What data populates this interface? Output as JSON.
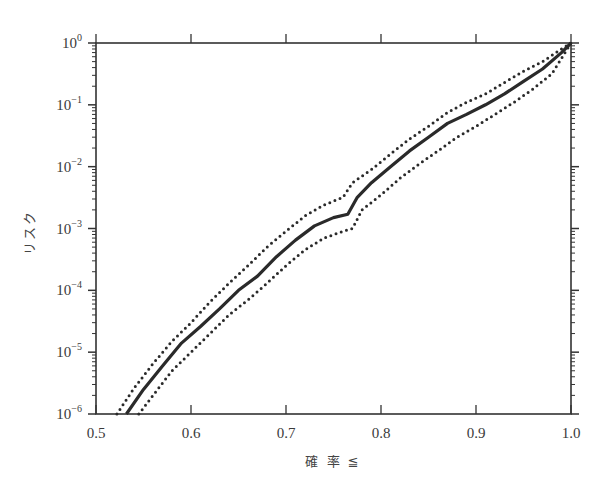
{
  "chart_data": {
    "type": "line",
    "title": "",
    "xlabel": "確 率 ≦",
    "ylabel": "リスク",
    "xlim": [
      0.5,
      1.0
    ],
    "ylim": [
      1e-06,
      1
    ],
    "yscale": "log",
    "grid": false,
    "legend": null,
    "x_ticks": [
      "0.5",
      "0.6",
      "0.7",
      "0.8",
      "0.9",
      "1.0"
    ],
    "y_ticks": [
      {
        "base": "10",
        "exp": "0"
      },
      {
        "base": "10",
        "exp": "−1"
      },
      {
        "base": "10",
        "exp": "−2"
      },
      {
        "base": "10",
        "exp": "−3"
      },
      {
        "base": "10",
        "exp": "−4"
      },
      {
        "base": "10",
        "exp": "−5"
      },
      {
        "base": "10",
        "exp": "−6"
      }
    ],
    "series": [
      {
        "name": "median",
        "style": "solid-thick",
        "x": [
          0.532,
          0.55,
          0.57,
          0.59,
          0.61,
          0.63,
          0.65,
          0.67,
          0.69,
          0.71,
          0.73,
          0.75,
          0.765,
          0.775,
          0.79,
          0.81,
          0.83,
          0.85,
          0.87,
          0.89,
          0.91,
          0.93,
          0.95,
          0.97,
          0.99,
          1.0
        ],
        "values": [
          1e-06,
          2.5e-06,
          6e-06,
          1.4e-05,
          2.6e-05,
          5e-05,
          0.0001,
          0.00017,
          0.00035,
          0.00065,
          0.0011,
          0.0015,
          0.0017,
          0.0032,
          0.0055,
          0.01,
          0.018,
          0.03,
          0.05,
          0.07,
          0.1,
          0.15,
          0.24,
          0.38,
          0.7,
          1.0
        ]
      },
      {
        "name": "upper bound",
        "style": "dotted",
        "x": [
          0.522,
          0.54,
          0.56,
          0.58,
          0.6,
          0.62,
          0.64,
          0.66,
          0.68,
          0.7,
          0.72,
          0.74,
          0.76,
          0.77,
          0.79,
          0.81,
          0.83,
          0.85,
          0.87,
          0.89,
          0.91,
          0.93,
          0.95,
          0.97,
          0.99,
          1.0
        ],
        "values": [
          1e-06,
          2.6e-06,
          6.5e-06,
          1.5e-05,
          3e-05,
          6.5e-05,
          0.00013,
          0.00025,
          0.0005,
          0.0009,
          0.0016,
          0.0024,
          0.0032,
          0.0055,
          0.009,
          0.016,
          0.028,
          0.045,
          0.075,
          0.11,
          0.15,
          0.23,
          0.35,
          0.5,
          0.8,
          1.0
        ]
      },
      {
        "name": "lower bound",
        "style": "dotted",
        "x": [
          0.545,
          0.56,
          0.58,
          0.6,
          0.62,
          0.64,
          0.66,
          0.68,
          0.7,
          0.72,
          0.74,
          0.76,
          0.77,
          0.78,
          0.8,
          0.82,
          0.84,
          0.86,
          0.88,
          0.9,
          0.92,
          0.94,
          0.96,
          0.98,
          1.0
        ],
        "values": [
          1e-06,
          2e-06,
          5e-06,
          1e-05,
          2e-05,
          4e-05,
          7e-05,
          0.00013,
          0.00025,
          0.00045,
          0.0007,
          0.0009,
          0.001,
          0.002,
          0.0035,
          0.0065,
          0.011,
          0.018,
          0.03,
          0.045,
          0.07,
          0.11,
          0.18,
          0.32,
          1.0
        ]
      }
    ]
  },
  "plot": {
    "line_color": "#2a2a2a",
    "axis_color": "#333333"
  }
}
